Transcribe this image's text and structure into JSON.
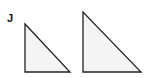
{
  "figure": {
    "label": "J",
    "shapes": [
      {
        "type": "right-triangle",
        "points": "25,24 25,72 70,72"
      },
      {
        "type": "right-triangle",
        "points": "83,12 83,72 141,72"
      }
    ],
    "fill_color": "#f4f4f4",
    "stroke_color": "#222222"
  }
}
